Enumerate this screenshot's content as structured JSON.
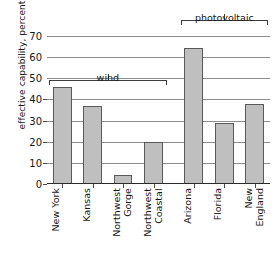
{
  "chart_data": {
    "type": "bar",
    "title": "",
    "xlabel": "",
    "ylabel": "effective capability, percent",
    "ylim": [
      0,
      70
    ],
    "yticks": [
      0,
      10,
      20,
      30,
      40,
      50,
      60,
      70
    ],
    "grid": true,
    "legend": "none",
    "categories": [
      "New York",
      "Northwest Gorge",
      "Northwest Coastal",
      "Arizona",
      "Florida",
      "New England",
      "Kansas"
    ],
    "bars": [
      {
        "label": "New York",
        "value": 46,
        "group": "wind"
      },
      {
        "label": "Kansas",
        "value": 37,
        "group": "wind"
      },
      {
        "label": "Northwest Gorge",
        "value": 4.5,
        "group": "wind"
      },
      {
        "label": "Northwest Coastal",
        "value": 20,
        "group": "wind"
      },
      {
        "label": "Arizona",
        "value": 64.5,
        "group": "photovoltaic"
      },
      {
        "label": "Florida",
        "value": 29,
        "group": "photovoltaic"
      },
      {
        "label": "New England",
        "value": 38,
        "group": "photovoltaic"
      }
    ],
    "values": [
      46,
      37,
      4.5,
      20,
      64.5,
      29,
      38
    ],
    "groups": [
      {
        "name": "wind",
        "label": "wind",
        "first_index": 0,
        "last_index": 3
      },
      {
        "name": "photovoltaic",
        "label": "photovoltaic",
        "first_index": 4,
        "last_index": 6
      }
    ],
    "colors": {
      "bar_fill": "#bfbfbf",
      "bar_stroke": "#5a5a5a",
      "gridline": "#8c8c8c",
      "axis": "#2b2b2b",
      "text": "#151515",
      "background": "#ffffff"
    }
  },
  "axis": {
    "y_title": "effective capability, percent",
    "y_tick_labels": [
      "70",
      "60",
      "50",
      "40",
      "30",
      "20",
      "10",
      "0"
    ]
  },
  "brackets": {
    "wind_label": "wind",
    "photovoltaic_label": "photovoltaic"
  },
  "x_labels": [
    {
      "line1": "New York",
      "line2": ""
    },
    {
      "line1": "Kansas",
      "line2": ""
    },
    {
      "line1": "Northwest",
      "line2": "Gorge"
    },
    {
      "line1": "Northwest",
      "line2": "Coastal"
    },
    {
      "line1": "Arizona",
      "line2": ""
    },
    {
      "line1": "Florida",
      "line2": ""
    },
    {
      "line1": "New",
      "line2": "England"
    }
  ]
}
